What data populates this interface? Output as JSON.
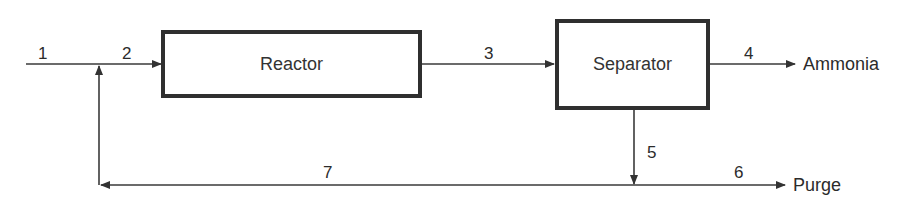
{
  "diagram": {
    "units": [
      {
        "id": "reactor",
        "label": "Reactor"
      },
      {
        "id": "separator",
        "label": "Separator"
      }
    ],
    "streams": [
      {
        "number": "1",
        "from": "feed",
        "to": "mixer"
      },
      {
        "number": "2",
        "from": "mixer",
        "to": "reactor"
      },
      {
        "number": "3",
        "from": "reactor",
        "to": "separator"
      },
      {
        "number": "4",
        "from": "separator",
        "to": "product"
      },
      {
        "number": "5",
        "from": "separator",
        "to": "splitter"
      },
      {
        "number": "6",
        "from": "splitter",
        "to": "purge"
      },
      {
        "number": "7",
        "from": "splitter",
        "to": "mixer"
      }
    ],
    "outputs": {
      "product": "Ammonia",
      "purge": "Purge"
    },
    "colors": {
      "line": "#3a3a3a",
      "box_border": "#2f2f2f",
      "text": "#2b2b2b"
    }
  }
}
